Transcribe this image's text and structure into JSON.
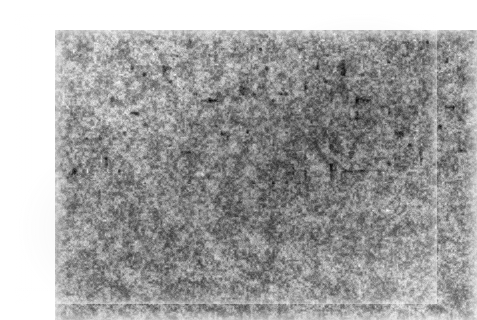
{
  "page": {
    "background_color": "#ffffff",
    "width": 459,
    "height": 318,
    "caption": ""
  },
  "figure": {
    "name": "micrograph",
    "kind": "grayscale-micrograph",
    "frame": {
      "x": 15,
      "y": 14,
      "width": 422,
      "height": 290
    },
    "has_scale_bar": false,
    "has_label_text": false,
    "border": "none",
    "palette": {
      "darkest": "#121212",
      "dark": "#3a3a3a",
      "mid_dark": "#6b6b6b",
      "mid": "#8f8f8f",
      "mid_light": "#b4b4b4",
      "light": "#d8d8d8",
      "lightest": "#f4f4f4",
      "page": "#ffffff"
    },
    "texture": {
      "grain_scale_px": 2.0,
      "cluster_scale_px": 9,
      "blob_scale_px": 22,
      "contrast": 1.18,
      "mean_level": 150,
      "seed": 20240517
    },
    "tonal_regions": [
      {
        "name": "center-dark-band",
        "cx": 0.58,
        "cy": 0.52,
        "rx": 200,
        "ry": 150,
        "delta": -24
      },
      {
        "name": "upper-right-dark",
        "cx": 0.82,
        "cy": 0.28,
        "rx": 150,
        "ry": 110,
        "delta": -16
      },
      {
        "name": "lower-left-dark",
        "cx": 0.26,
        "cy": 0.74,
        "rx": 140,
        "ry": 120,
        "delta": -13
      },
      {
        "name": "upper-left-light",
        "cx": 0.12,
        "cy": 0.16,
        "rx": 130,
        "ry": 90,
        "delta": 18
      },
      {
        "name": "lower-right-light",
        "cx": 0.9,
        "cy": 0.88,
        "rx": 120,
        "ry": 80,
        "delta": 13
      }
    ]
  }
}
